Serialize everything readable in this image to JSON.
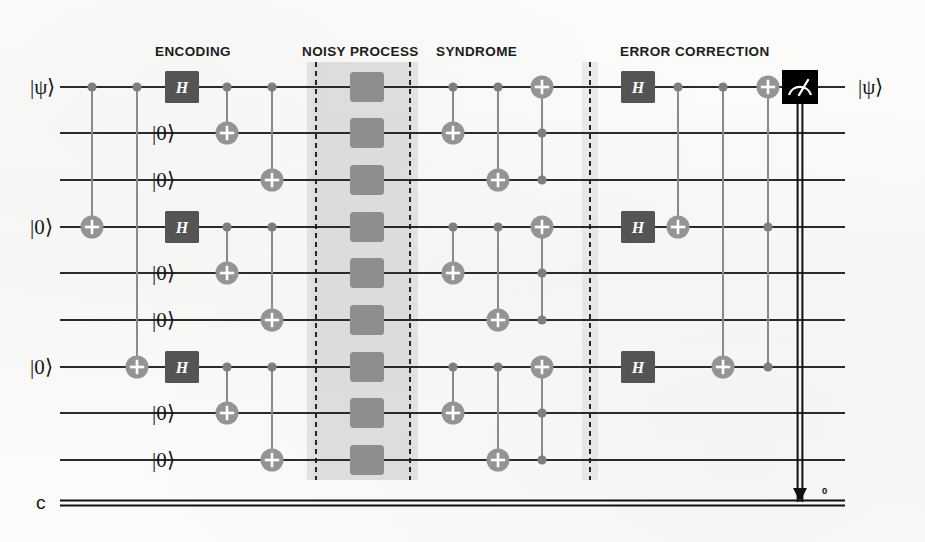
{
  "figure": {
    "colors": {
      "wire": "#2b2b2b",
      "gate_dark": "#545454",
      "gate_dark_text": "#ffffff",
      "cnot_gray": "#949494",
      "cnot_plus": "#ffffff",
      "control_dot": "#7e7e7e",
      "link": "#8a8a8a",
      "noise_band": "#d2d2d2",
      "noise_box": "#8e8e8e",
      "dashed_barrier": "#1e1e1e",
      "measure_box": "#000000",
      "measure_glyph": "#ffffff",
      "classical_wire": "#111111",
      "text": "#1b1b1b",
      "background": "#fbfbf9"
    }
  },
  "sections": [
    {
      "id": "encoding",
      "label": "ENCODING",
      "x": 155,
      "y": 44
    },
    {
      "id": "noisy-process",
      "label": "NOISY PROCESS",
      "x": 302,
      "y": 44
    },
    {
      "id": "syndrome",
      "label": "SYNDROME",
      "x": 436,
      "y": 44
    },
    {
      "id": "error-correction",
      "label": "ERROR CORRECTION",
      "x": 620,
      "y": 44
    }
  ],
  "wires": {
    "count": 9,
    "x_start": 60,
    "x_end": 845,
    "y": [
      87,
      133,
      180,
      227,
      273,
      320,
      367,
      413,
      460
    ],
    "input_labels": [
      {
        "wire": 0,
        "text": "|ψ⟩",
        "x": 30
      },
      {
        "wire": 1,
        "text": "|0⟩",
        "x": 152
      },
      {
        "wire": 2,
        "text": "|0⟩",
        "x": 152
      },
      {
        "wire": 3,
        "text": "|0⟩",
        "x": 30
      },
      {
        "wire": 4,
        "text": "|0⟩",
        "x": 152
      },
      {
        "wire": 5,
        "text": "|0⟩",
        "x": 152
      },
      {
        "wire": 6,
        "text": "|0⟩",
        "x": 30
      },
      {
        "wire": 7,
        "text": "|0⟩",
        "x": 152
      },
      {
        "wire": 8,
        "text": "|0⟩",
        "x": 152
      }
    ],
    "output_label": {
      "text": "|ψ⟩",
      "x": 858,
      "wire": 0
    }
  },
  "classical_register": {
    "label": "c",
    "label_x": 36,
    "y": 503,
    "x_start": 60,
    "x_end": 845,
    "bit_index": "0",
    "bit_index_x": 822,
    "bit_index_y": 485
  },
  "noise_band": {
    "x": 307,
    "width": 111,
    "y": 62,
    "height": 418,
    "dash_left_x": 316,
    "dash_right_x": 410,
    "box_x": 350,
    "box_width": 34,
    "box_height": 30
  },
  "barrier": {
    "x": 590,
    "y": 62,
    "height": 418,
    "band_x": 582,
    "band_width": 16
  },
  "measurement": {
    "x": 800,
    "y_wire": 0,
    "width": 36,
    "height": 34,
    "glyph": "measure-meter-icon",
    "drop_to_classical": true
  },
  "gates": {
    "encoding": [
      {
        "type": "cnot",
        "control": 0,
        "target": 3,
        "x": 92
      },
      {
        "type": "cnot",
        "control": 0,
        "target": 6,
        "x": 137
      },
      {
        "type": "h",
        "wire": 0,
        "x": 182,
        "label": "H"
      },
      {
        "type": "h",
        "wire": 3,
        "x": 182,
        "label": "H"
      },
      {
        "type": "h",
        "wire": 6,
        "x": 182,
        "label": "H"
      },
      {
        "type": "cnot",
        "control": 0,
        "target": 1,
        "x": 227
      },
      {
        "type": "cnot",
        "control": 3,
        "target": 4,
        "x": 227
      },
      {
        "type": "cnot",
        "control": 6,
        "target": 7,
        "x": 227
      },
      {
        "type": "cnot",
        "control": 0,
        "target": 2,
        "x": 272
      },
      {
        "type": "cnot",
        "control": 3,
        "target": 5,
        "x": 272
      },
      {
        "type": "cnot",
        "control": 6,
        "target": 8,
        "x": 272
      }
    ],
    "noise": [
      {
        "type": "noise-box",
        "wire": 0
      },
      {
        "type": "noise-box",
        "wire": 1
      },
      {
        "type": "noise-box",
        "wire": 2
      },
      {
        "type": "noise-box",
        "wire": 3
      },
      {
        "type": "noise-box",
        "wire": 4
      },
      {
        "type": "noise-box",
        "wire": 5
      },
      {
        "type": "noise-box",
        "wire": 6
      },
      {
        "type": "noise-box",
        "wire": 7
      },
      {
        "type": "noise-box",
        "wire": 8
      }
    ],
    "syndrome": [
      {
        "type": "cnot",
        "control": 0,
        "target": 1,
        "x": 453
      },
      {
        "type": "cnot",
        "control": 3,
        "target": 4,
        "x": 453
      },
      {
        "type": "cnot",
        "control": 6,
        "target": 7,
        "x": 453
      },
      {
        "type": "cnot",
        "control": 0,
        "target": 2,
        "x": 498
      },
      {
        "type": "cnot",
        "control": 3,
        "target": 5,
        "x": 498
      },
      {
        "type": "cnot",
        "control": 6,
        "target": 8,
        "x": 498
      },
      {
        "type": "toffoli",
        "controls": [
          1,
          2
        ],
        "target": 0,
        "x": 542
      },
      {
        "type": "toffoli",
        "controls": [
          4,
          5
        ],
        "target": 3,
        "x": 542
      },
      {
        "type": "toffoli",
        "controls": [
          7,
          8
        ],
        "target": 6,
        "x": 542
      }
    ],
    "correction": [
      {
        "type": "h",
        "wire": 0,
        "x": 638,
        "label": "H"
      },
      {
        "type": "h",
        "wire": 3,
        "x": 638,
        "label": "H"
      },
      {
        "type": "h",
        "wire": 6,
        "x": 638,
        "label": "H"
      },
      {
        "type": "cnot",
        "control": 0,
        "target": 3,
        "x": 678
      },
      {
        "type": "cnot",
        "control": 0,
        "target": 6,
        "x": 723
      },
      {
        "type": "toffoli",
        "controls": [
          3,
          6
        ],
        "target": 0,
        "x": 768
      }
    ]
  }
}
